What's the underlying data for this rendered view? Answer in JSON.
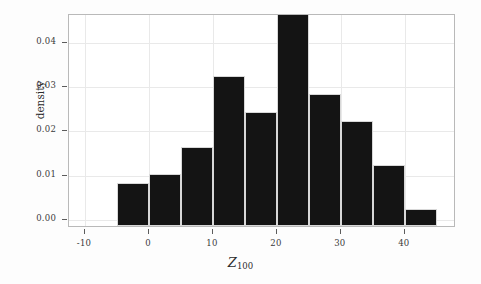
{
  "chart_data": {
    "type": "bar",
    "title": "",
    "subtitle": "",
    "xlabel": "Z_100",
    "xlabel_symbol": "Z",
    "xlabel_subscript": "100",
    "ylabel": "density",
    "bin_width": 5,
    "bin_edges": [
      -5,
      0,
      5,
      10,
      15,
      20,
      25,
      30,
      35,
      40,
      45
    ],
    "categories": [
      "-5 to 0",
      "0 to 5",
      "5 to 10",
      "10 to 15",
      "15 to 20",
      "20 to 25",
      "25 to 30",
      "30 to 35",
      "35 to 40",
      "40 to 45"
    ],
    "bin_centers": [
      -2.5,
      2.5,
      7.5,
      12.5,
      17.5,
      22.5,
      27.5,
      32.5,
      37.5,
      42.5
    ],
    "values": [
      0.008,
      0.01,
      0.016,
      0.032,
      0.024,
      0.046,
      0.028,
      0.022,
      0.012,
      0.002
    ],
    "xlim": [
      -12.5,
      48
    ],
    "ylim": [
      -0.0018,
      0.0463
    ],
    "xticks": [
      -10,
      0,
      10,
      20,
      30,
      40
    ],
    "xtick_labels": [
      "-10",
      "0",
      "10",
      "20",
      "30",
      "40"
    ],
    "yticks": [
      0.0,
      0.01,
      0.02,
      0.03,
      0.04
    ],
    "ytick_labels": [
      "0.00",
      "0.01",
      "0.02",
      "0.03",
      "0.04"
    ],
    "grid": true,
    "grid_color": "#e9e9e9",
    "legend": null,
    "bar_color": "#141414",
    "bar_edge_color": "#d8d8d8",
    "frame_color": "#b9b9b9",
    "background_color": "#ffffff"
  }
}
